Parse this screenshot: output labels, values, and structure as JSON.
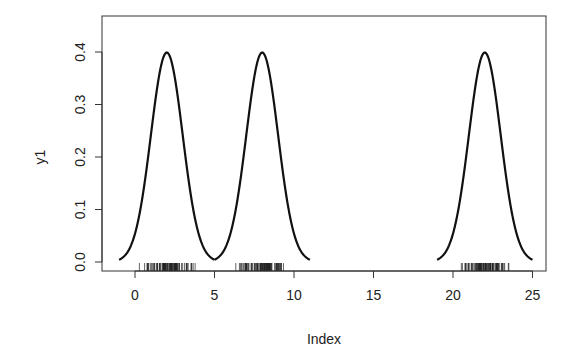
{
  "chart_data": {
    "type": "line",
    "title": "",
    "xlabel": "Index",
    "ylabel": "y1",
    "xlim": [
      -2.1,
      25.9
    ],
    "ylim": [
      -0.016,
      0.438
    ],
    "x_ticks": [
      0,
      5,
      10,
      15,
      20,
      25
    ],
    "y_ticks": [
      0.0,
      0.1,
      0.2,
      0.3,
      0.4
    ],
    "y_tick_labels": [
      "0.0",
      "0.1",
      "0.2",
      "0.3",
      "0.4"
    ],
    "grid": false,
    "legend": null,
    "series": [
      {
        "name": "curve1",
        "distribution": "normal",
        "mean": 2,
        "sd": 1,
        "x_range": [
          -1,
          5
        ],
        "peak": 0.399
      },
      {
        "name": "curve2",
        "distribution": "normal",
        "mean": 8,
        "sd": 1,
        "x_range": [
          5,
          11
        ],
        "peak": 0.399
      },
      {
        "name": "curve3",
        "distribution": "normal",
        "mean": 22,
        "sd": 1,
        "x_range": [
          19,
          25
        ],
        "peak": 0.399
      }
    ],
    "rug": {
      "clusters": [
        {
          "center": 2,
          "range": [
            0,
            4.6
          ]
        },
        {
          "center": 8,
          "range": [
            5.5,
            11.2
          ]
        },
        {
          "center": 22,
          "range": [
            19.6,
            24.5
          ]
        }
      ]
    }
  },
  "axes": {
    "xlabel": "Index",
    "ylabel": "y1"
  }
}
